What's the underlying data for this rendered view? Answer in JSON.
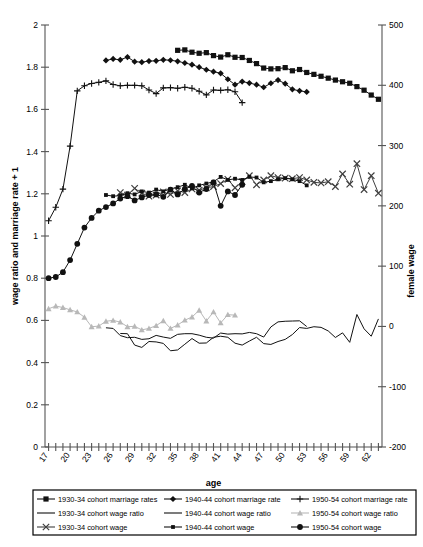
{
  "chart_data": {
    "type": "line",
    "title": "",
    "xlabel": "age",
    "ylabel": "wage ratio and marriage rate + 1",
    "y2label": "female wage",
    "xlim": [
      16.5,
      63.5
    ],
    "ylim": [
      0,
      2
    ],
    "y2lim": [
      -200,
      500
    ],
    "ytick_step": 0.2,
    "y2tick_step": 100,
    "xticks": [
      17,
      20,
      23,
      26,
      29,
      32,
      35,
      38,
      41,
      44,
      47,
      50,
      53,
      56,
      59,
      62
    ],
    "yticks": [
      "0",
      "0.2",
      "0.4",
      "0.6",
      "0.8",
      "1",
      "1.2",
      "1.4",
      "1.6",
      "1.8",
      "2"
    ],
    "y2ticks": [
      "-200",
      "-100",
      "0",
      "100",
      "200",
      "300",
      "400",
      "500"
    ],
    "xtick_all": [
      17,
      18,
      19,
      20,
      21,
      22,
      23,
      24,
      25,
      26,
      27,
      28,
      29,
      30,
      31,
      32,
      33,
      34,
      35,
      36,
      37,
      38,
      39,
      40,
      41,
      42,
      43,
      44,
      45,
      46,
      47,
      48,
      49,
      50,
      51,
      52,
      53,
      54,
      55,
      56,
      57,
      58,
      59,
      60,
      61,
      62,
      63
    ],
    "grid": false,
    "legend_position": "bottom",
    "series": [
      {
        "name": "1930-34 cohort marriage rates",
        "key": "mar3034",
        "axis": "left",
        "marker": "square",
        "color": "#111111",
        "x": [
          35,
          36,
          37,
          38,
          39,
          40,
          41,
          42,
          43,
          44,
          45,
          46,
          47,
          48,
          49,
          50,
          51,
          52,
          53,
          54,
          55,
          56,
          57,
          58,
          59,
          60,
          61,
          62,
          63
        ],
        "y": [
          1.88,
          1.882,
          1.871,
          1.866,
          1.869,
          1.855,
          1.848,
          1.859,
          1.847,
          1.846,
          1.832,
          1.817,
          1.796,
          1.792,
          1.793,
          1.798,
          1.783,
          1.789,
          1.775,
          1.766,
          1.757,
          1.748,
          1.739,
          1.731,
          1.724,
          1.708,
          1.691,
          1.668,
          1.648
        ]
      },
      {
        "name": "1940-44 cohort marriage rate",
        "key": "mar4044",
        "axis": "left",
        "marker": "diamond",
        "color": "#111111",
        "x": [
          25,
          26,
          27,
          28,
          29,
          30,
          31,
          32,
          33,
          34,
          35,
          36,
          37,
          38,
          39,
          40,
          41,
          42,
          43,
          44,
          45,
          46,
          47,
          48,
          49,
          50,
          51,
          52,
          53
        ],
        "y": [
          1.832,
          1.839,
          1.835,
          1.848,
          1.826,
          1.824,
          1.829,
          1.83,
          1.835,
          1.833,
          1.828,
          1.82,
          1.812,
          1.8,
          1.788,
          1.779,
          1.771,
          1.743,
          1.717,
          1.732,
          1.725,
          1.717,
          1.705,
          1.724,
          1.739,
          1.722,
          1.695,
          1.688,
          1.683
        ]
      },
      {
        "name": "1950-54 cohort marriage rate",
        "key": "mar5054",
        "axis": "left",
        "marker": "plus",
        "color": "#111111",
        "x": [
          17,
          18,
          19,
          20,
          21,
          22,
          23,
          24,
          25,
          26,
          27,
          28,
          29,
          30,
          31,
          32,
          33,
          34,
          35,
          36,
          37,
          38,
          39,
          40,
          41,
          42,
          43,
          44
        ],
        "y": [
          1.072,
          1.136,
          1.222,
          1.426,
          1.688,
          1.712,
          1.723,
          1.728,
          1.735,
          1.718,
          1.712,
          1.714,
          1.714,
          1.712,
          1.692,
          1.675,
          1.702,
          1.703,
          1.7,
          1.705,
          1.7,
          1.686,
          1.669,
          1.692,
          1.69,
          1.693,
          1.684,
          1.632
        ]
      },
      {
        "name": "1930-34 cohort wage ratio",
        "key": "wr3034",
        "axis": "left",
        "marker": "none",
        "color": "#111111",
        "x": [
          27,
          28,
          29,
          30,
          31,
          32,
          33,
          34,
          35,
          36,
          37,
          38,
          39,
          40,
          41,
          42,
          43,
          44,
          45,
          46,
          47,
          48,
          49,
          50,
          51,
          52,
          53,
          54,
          55,
          56,
          57,
          58,
          59,
          60,
          61,
          62,
          63
        ],
        "y": [
          0.538,
          0.537,
          0.483,
          0.472,
          0.5,
          0.498,
          0.491,
          0.456,
          0.46,
          0.487,
          0.514,
          0.492,
          0.493,
          0.52,
          0.525,
          0.52,
          0.492,
          0.483,
          0.502,
          0.52,
          0.49,
          0.486,
          0.5,
          0.51,
          0.533,
          0.566,
          0.562,
          0.57,
          0.567,
          0.55,
          0.519,
          0.541,
          0.496,
          0.628,
          0.56,
          0.525,
          0.607
        ]
      },
      {
        "name": "1940-44 cohort wage ratio",
        "key": "wr4044",
        "axis": "left",
        "marker": "none",
        "color": "#111111",
        "x": [
          25,
          26,
          27,
          28,
          29,
          30,
          31,
          32,
          33,
          34,
          35,
          36,
          37,
          38,
          39,
          40,
          41,
          42,
          43,
          44,
          45,
          46,
          47,
          48,
          49,
          50,
          51,
          52,
          53
        ],
        "y": [
          0.565,
          0.562,
          0.528,
          0.518,
          0.52,
          0.51,
          0.513,
          0.529,
          0.521,
          0.515,
          0.534,
          0.537,
          0.537,
          0.53,
          0.52,
          0.516,
          0.54,
          0.535,
          0.537,
          0.536,
          0.543,
          0.537,
          0.521,
          0.569,
          0.593,
          0.596,
          0.597,
          0.598,
          0.571
        ]
      },
      {
        "name": "1950-54 cohort wage ratio",
        "key": "wr5054",
        "axis": "left",
        "marker": "triangle",
        "color": "#b8b8b8",
        "x": [
          17,
          18,
          19,
          20,
          21,
          22,
          23,
          24,
          25,
          26,
          27,
          28,
          29,
          30,
          31,
          32,
          33,
          34,
          35,
          36,
          37,
          38,
          39,
          40,
          41,
          42,
          43
        ],
        "y": [
          0.655,
          0.668,
          0.661,
          0.65,
          0.64,
          0.615,
          0.57,
          0.573,
          0.596,
          0.6,
          0.592,
          0.57,
          0.572,
          0.555,
          0.562,
          0.575,
          0.598,
          0.562,
          0.578,
          0.601,
          0.616,
          0.648,
          0.597,
          0.64,
          0.588,
          0.627,
          0.625
        ]
      },
      {
        "name": "1930-34 cohort wage",
        "key": "w3034",
        "axis": "right",
        "marker": "x",
        "color": "#3f3f3f",
        "x": [
          27,
          28,
          29,
          30,
          31,
          32,
          33,
          34,
          35,
          36,
          37,
          38,
          39,
          40,
          41,
          42,
          43,
          44,
          45,
          46,
          47,
          48,
          49,
          50,
          51,
          52,
          53,
          54,
          55,
          56,
          57,
          58,
          59,
          60,
          61,
          62,
          63
        ],
        "y": [
          222,
          218,
          229,
          221,
          216,
          218,
          223,
          219,
          225,
          222,
          228,
          226,
          230,
          232,
          237,
          244,
          230,
          240,
          250,
          235,
          243,
          250,
          247,
          246,
          245,
          247,
          243,
          239,
          238,
          240,
          232,
          253,
          236,
          270,
          227,
          250,
          221
        ]
      },
      {
        "name": "1940-44 cohort wage",
        "key": "w4044",
        "axis": "right",
        "marker": "square-small",
        "color": "#111111",
        "x": [
          25,
          26,
          27,
          28,
          29,
          30,
          31,
          32,
          33,
          34,
          35,
          36,
          37,
          38,
          39,
          40,
          41,
          42,
          43,
          44,
          45,
          46,
          47,
          48,
          49,
          50,
          51,
          52,
          53
        ],
        "y": [
          218,
          216,
          217,
          221,
          219,
          224,
          222,
          227,
          224,
          228,
          231,
          235,
          229,
          234,
          237,
          240,
          248,
          243,
          245,
          243,
          248,
          247,
          239,
          241,
          244,
          246,
          244,
          241,
          234
        ]
      },
      {
        "name": "1950-54 cohort wage",
        "key": "w5054",
        "axis": "right",
        "marker": "circle",
        "color": "#111111",
        "x": [
          17,
          18,
          19,
          20,
          21,
          22,
          23,
          24,
          25,
          26,
          27,
          28,
          29,
          30,
          31,
          32,
          33,
          34,
          35,
          36,
          37,
          38,
          39,
          40,
          41,
          42,
          43,
          44
        ],
        "y": [
          80,
          82,
          90,
          110,
          137,
          164,
          180,
          192,
          198,
          204,
          212,
          216,
          209,
          214,
          218,
          219,
          215,
          227,
          219,
          228,
          233,
          222,
          228,
          239,
          200,
          224,
          218,
          235
        ]
      }
    ],
    "legend": [
      {
        "label": "1930-34 cohort marriage rates",
        "marker": "square",
        "color": "#111111"
      },
      {
        "label": "1940-44 cohort marriage rate",
        "marker": "diamond",
        "color": "#111111"
      },
      {
        "label": "1950-54 cohort marriage rate",
        "marker": "plus",
        "color": "#111111"
      },
      {
        "label": "1930-34 cohort wage ratio",
        "marker": "none",
        "color": "#111111"
      },
      {
        "label": "1940-44 cohort wage ratio",
        "marker": "none",
        "color": "#111111"
      },
      {
        "label": "1950-54 cohort wage ratio",
        "marker": "triangle",
        "color": "#b8b8b8"
      },
      {
        "label": "1930-34 cohort wage",
        "marker": "x",
        "color": "#3f3f3f"
      },
      {
        "label": "1940-44 cohort wage",
        "marker": "square-small",
        "color": "#111111"
      },
      {
        "label": "1950-54 cohort wage",
        "marker": "circle",
        "color": "#111111"
      }
    ]
  }
}
